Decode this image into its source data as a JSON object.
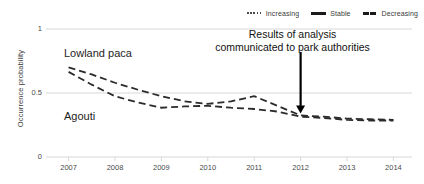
{
  "chart_data": {
    "type": "line",
    "title": "",
    "xlabel": "",
    "ylabel": "Occurrence probability",
    "xlim": [
      2006.6,
      2014.4
    ],
    "ylim": [
      0,
      1
    ],
    "yticks": [
      "0",
      "0.5",
      "1"
    ],
    "ytick_values": [
      0,
      0.5,
      1
    ],
    "xticks": [
      "2007",
      "2008",
      "2009",
      "2010",
      "2011",
      "2012",
      "2013",
      "2014"
    ],
    "xtick_values": [
      2007,
      2008,
      2009,
      2010,
      2011,
      2012,
      2013,
      2014
    ],
    "grid": "horizontal-light",
    "legend_position": "top-right",
    "legend": [
      {
        "label": "Increasing",
        "style": "dotted"
      },
      {
        "label": "Stable",
        "style": "solid"
      },
      {
        "label": "Decreasing",
        "style": "dashed"
      }
    ],
    "series": [
      {
        "name": "Lowland paca",
        "style": "dashed",
        "color": "#2b2b2b",
        "x": [
          2007,
          2007.5,
          2008,
          2008.5,
          2009,
          2009.5,
          2010,
          2010.5,
          2011,
          2011.5,
          2012,
          2012.5,
          2013,
          2013.5,
          2014
        ],
        "values": [
          0.7,
          0.645,
          0.58,
          0.525,
          0.475,
          0.435,
          0.415,
          0.435,
          0.475,
          0.4,
          0.325,
          0.315,
          0.3,
          0.295,
          0.29
        ]
      },
      {
        "name": "Agouti",
        "style": "dashed",
        "color": "#2b2b2b",
        "x": [
          2007,
          2007.5,
          2008,
          2008.5,
          2009,
          2009.5,
          2010,
          2010.5,
          2011,
          2011.5,
          2012,
          2012.5,
          2013,
          2013.5,
          2014
        ],
        "values": [
          0.665,
          0.565,
          0.475,
          0.425,
          0.385,
          0.395,
          0.4,
          0.385,
          0.375,
          0.355,
          0.315,
          0.305,
          0.29,
          0.285,
          0.285
        ]
      }
    ],
    "series_labels": [
      {
        "text": "Lowland paca",
        "target": "Lowland paca"
      },
      {
        "text": "Agouti",
        "target": "Agouti"
      }
    ],
    "annotations": [
      {
        "text_lines": [
          "Results of analysis",
          "communicated to park authorities"
        ],
        "arrow": {
          "x": 2012,
          "from_y": 0.82,
          "to_y": 0.34
        }
      }
    ]
  },
  "axes": {
    "y_title": "Occurrence probability",
    "y_ticks": [
      "1",
      "0.5",
      "0"
    ],
    "x_ticks": [
      "2007",
      "2008",
      "2009",
      "2010",
      "2011",
      "2012",
      "2013",
      "2014"
    ]
  },
  "legend": {
    "items": [
      {
        "label": "Increasing"
      },
      {
        "label": "Stable"
      },
      {
        "label": "Decreasing"
      }
    ]
  },
  "labels": {
    "lowland_paca": "Lowland paca",
    "agouti": "Agouti"
  },
  "annotation": {
    "line1": "Results of analysis",
    "line2": "communicated to park authorities"
  },
  "colors": {
    "line": "#2b2b2b",
    "grid": "#d8d8d8",
    "text": "#3d3d3d",
    "annotation": "#111111"
  }
}
